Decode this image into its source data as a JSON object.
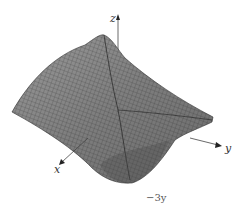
{
  "figure": {
    "type": "3d-surface-plot",
    "axes": {
      "x_label": "x",
      "y_label": "y",
      "z_label": "z"
    },
    "caption_fragment": "−3y",
    "colors": {
      "surface_fill": "#8a8a8a",
      "mesh_lines": "#2a2a2a",
      "axis": "#444444",
      "background": "#ffffff"
    }
  }
}
